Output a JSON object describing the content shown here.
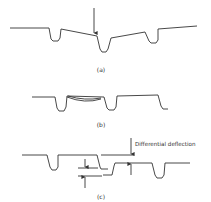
{
  "figure": {
    "panels": [
      {
        "id": "a",
        "label": "(a)",
        "description": "Load applied at a joint between two plates, causing hinging"
      },
      {
        "id": "b",
        "label": "(b)",
        "description": "Plate sagging between supports"
      },
      {
        "id": "c",
        "label": "(c)",
        "description": "Adjacent plates offset vertically"
      }
    ],
    "annotations": {
      "differential_deflection": "Differential deflection"
    }
  }
}
